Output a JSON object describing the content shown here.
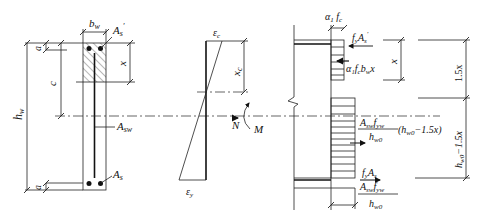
{
  "figure": {
    "type": "engineering-diagram"
  },
  "section": {
    "width_label": "b",
    "width_sub": "w",
    "top_steel_label": "A",
    "top_steel_sub": "s",
    "top_steel_prime": "′",
    "bottom_steel_label": "A",
    "bottom_steel_sub": "s",
    "web_steel_label": "A",
    "web_steel_sub": "sw",
    "height_label": "h",
    "height_sub": "w",
    "cover_top": "a",
    "cover_bottom": "a",
    "centroid_dist": "c",
    "compression_depth": "x"
  },
  "strain": {
    "top_label": "ε",
    "top_sub": "c",
    "bottom_label": "ε",
    "bottom_sub": "y",
    "depth_label": "x",
    "depth_sub": "c",
    "axial_label": "N",
    "moment_label": "M"
  },
  "stress": {
    "block_width_a": "α",
    "block_width_a_sub": "1",
    "block_width_f": "f",
    "block_width_f_sub": "c",
    "top_force_f": "f",
    "top_force_f_sub": "y",
    "top_force_A": "A",
    "top_force_A_sub": "s",
    "top_force_prime": "′",
    "concrete_force": "α₁f",
    "concrete_force_c": "c",
    "concrete_force_b": "b",
    "concrete_force_w": "w",
    "concrete_force_x": "x",
    "web_force_num_A": "A",
    "web_force_num_sw": "sw",
    "web_force_num_f": "f",
    "web_force_num_yw": "yw",
    "web_force_den_h": "h",
    "web_force_den_w0": "w0",
    "web_force_mult": "(h",
    "web_force_mult_sub": "w0",
    "web_force_mult_tail": "−1.5x)",
    "bottom_force_f": "f",
    "bottom_force_f_sub": "y",
    "bottom_force_A": "A",
    "bottom_force_A_sub": "s",
    "bottom_width_num_A": "A",
    "bottom_width_num_sw": "sw",
    "bottom_width_num_f": "f",
    "bottom_width_num_yw": "yw",
    "bottom_width_den_h": "h",
    "bottom_width_den_w0": "w0"
  },
  "dimensions": {
    "x_label": "x",
    "upper_label": "1.5x",
    "lower_label_h": "h",
    "lower_label_sub": "w0",
    "lower_label_tail": "−1.5x"
  }
}
